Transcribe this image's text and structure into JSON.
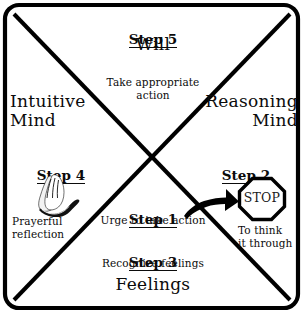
{
  "diagram": {
    "frame": {
      "stroke_color": "#000000",
      "background_color": "#ffffff"
    },
    "quadrants": {
      "top": {
        "step_label": "Step 5",
        "title": "Will",
        "description": "Take appropriate\naction"
      },
      "left": {
        "title": "Intuitive\nMind",
        "step_label": "Step 4",
        "icon": "praying-hands-icon",
        "description": "Prayerful\nreflection"
      },
      "right": {
        "title": "Reasoning\nMind",
        "step_label": "Step 2",
        "icon": "stop-sign-icon",
        "stop_text": "STOP",
        "description": "To think\nit through"
      },
      "bottom": {
        "title": "Feelings",
        "step1_label": "Step 1",
        "step1_description": "Urge to take action",
        "step3_label": "Step 3",
        "step3_description": "Recognize feelings"
      }
    },
    "arrow": {
      "name": "curved-arrow-icon",
      "direction": "up-right",
      "color": "#000000"
    }
  }
}
